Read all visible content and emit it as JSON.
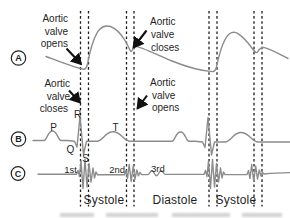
{
  "figure": {
    "row_markers": {
      "a": "A",
      "b": "B",
      "c": "C"
    },
    "annotations": {
      "opens_left": {
        "line1": "Aortic",
        "line2": "valve",
        "line3": "opens"
      },
      "closes_left": {
        "line1": "Aortic",
        "line2": "valve",
        "line3": "closes"
      },
      "closes_top": {
        "line1": "Aortic",
        "line2": "valve",
        "line3": "closes"
      },
      "opens_right": {
        "line1": "Aortic",
        "line2": "valve",
        "line3": "opens"
      }
    },
    "ecg_labels": {
      "p": "P",
      "q": "Q",
      "r": "R",
      "s": "S",
      "t": "T"
    },
    "sound_labels": {
      "first": "1st",
      "second": "2nd",
      "third": "3rd"
    },
    "phase_labels": {
      "systole1": "Systole",
      "diastole": "Diastole",
      "systole2": "Systole"
    },
    "colors": {
      "ink": "#1f1f1f",
      "trace": "#8c8c8c",
      "background": "#ffffff"
    }
  }
}
